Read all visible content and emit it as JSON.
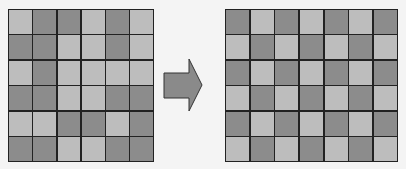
{
  "left_grid": {
    "rows": 6,
    "cols": 6,
    "cells": [
      [
        "L",
        "D",
        "D",
        "L",
        "D",
        "L"
      ],
      [
        "D",
        "D",
        "L",
        "L",
        "D",
        "L"
      ],
      [
        "L",
        "D",
        "L",
        "L",
        "L",
        "L"
      ],
      [
        "D",
        "D",
        "L",
        "L",
        "D",
        "D"
      ],
      [
        "L",
        "L",
        "D",
        "D",
        "L",
        "D"
      ],
      [
        "D",
        "D",
        "L",
        "L",
        "D",
        "D"
      ]
    ]
  },
  "right_grid": {
    "rows": 6,
    "cols": 7,
    "cells": [
      [
        "D",
        "L",
        "D",
        "L",
        "D",
        "L",
        "D"
      ],
      [
        "L",
        "D",
        "L",
        "D",
        "L",
        "D",
        "L"
      ],
      [
        "D",
        "L",
        "D",
        "L",
        "D",
        "L",
        "D"
      ],
      [
        "L",
        "D",
        "L",
        "D",
        "L",
        "D",
        "L"
      ],
      [
        "D",
        "L",
        "D",
        "L",
        "D",
        "L",
        "D"
      ],
      [
        "L",
        "D",
        "L",
        "D",
        "L",
        "D",
        "L"
      ]
    ]
  },
  "arrow": {
    "icon": "right-arrow-icon",
    "direction": "right"
  },
  "colors": {
    "dark": "#8c8c8c",
    "light": "#bdbdbd",
    "border": "#222222",
    "arrow_fill": "#8a8a8a"
  }
}
